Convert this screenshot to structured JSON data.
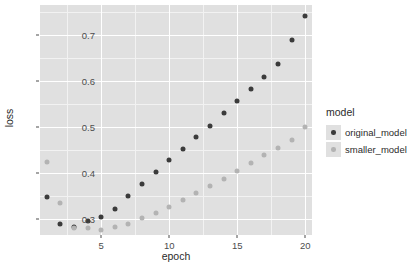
{
  "chart_data": {
    "type": "scatter",
    "title": "",
    "xlabel": "epoch",
    "ylabel": "loss",
    "xlim": [
      0.5,
      20.5
    ],
    "ylim": [
      0.265,
      0.765
    ],
    "grid": true,
    "legend_position": "right",
    "legend_title": "model",
    "x_ticks": [
      "5",
      "10",
      "15",
      "20"
    ],
    "x_tick_values": [
      5,
      10,
      15,
      20
    ],
    "y_ticks": [
      "0.3",
      "0.4",
      "0.5",
      "0.6",
      "0.7"
    ],
    "y_tick_values": [
      0.3,
      0.4,
      0.5,
      0.6,
      0.7
    ],
    "x": [
      1,
      2,
      3,
      4,
      5,
      6,
      7,
      8,
      9,
      10,
      11,
      12,
      13,
      14,
      15,
      16,
      17,
      18,
      19,
      20
    ],
    "series": [
      {
        "name": "original_model",
        "color": "#3b3b3b",
        "values": [
          0.347,
          0.288,
          0.283,
          0.296,
          0.305,
          0.322,
          0.349,
          0.376,
          0.401,
          0.427,
          0.452,
          0.478,
          0.503,
          0.53,
          0.556,
          0.583,
          0.609,
          0.637,
          0.689,
          0.741
        ]
      },
      {
        "name": "smaller_model",
        "color": "#b3b3b3",
        "values": [
          0.424,
          0.334,
          0.281,
          0.281,
          0.276,
          0.283,
          0.288,
          0.301,
          0.312,
          0.326,
          0.341,
          0.356,
          0.371,
          0.387,
          0.404,
          0.421,
          0.438,
          0.455,
          0.472,
          0.5
        ]
      }
    ]
  },
  "legend": {
    "title": "model",
    "items": [
      {
        "label": "original_model",
        "color": "#3b3b3b"
      },
      {
        "label": "smaller_model",
        "color": "#b3b3b3"
      }
    ]
  },
  "axes": {
    "x_title": "epoch",
    "y_title": "loss"
  },
  "colors": {
    "panel_background": "#e0e0e0",
    "grid_major": "#ffffff",
    "grid_minor": "#f2f2f2",
    "page_background": "#ffffff",
    "tick_text": "#4d4d4d",
    "title_text": "#2b2b2b"
  }
}
